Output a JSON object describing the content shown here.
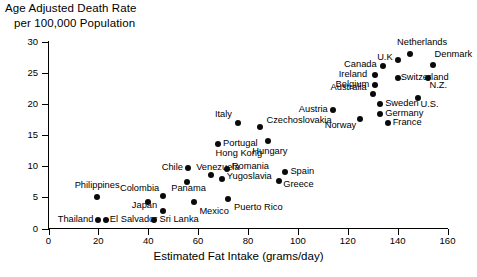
{
  "chart_data": {
    "type": "scatter",
    "title": "Age Adjusted Death Rate per 100,000 Population",
    "title_line1": "Age Adjusted Death Rate",
    "title_line2": "per 100,000 Population",
    "xlabel": "Estimated Fat Intake (grams/day)",
    "ylabel": "Age Adjusted Death Rate per 100,000 Population",
    "xlim": [
      0,
      160
    ],
    "ylim": [
      0,
      30
    ],
    "xticks": [
      0,
      20,
      40,
      60,
      80,
      100,
      120,
      140,
      160
    ],
    "yticks": [
      0,
      5,
      10,
      15,
      20,
      25,
      30
    ],
    "grid": false,
    "legend": "none",
    "marker_color": "#0a0a0a",
    "points": [
      {
        "label": "Thailand",
        "x": 20,
        "y": 1.4,
        "lx": 20,
        "ly": 1.4,
        "align": "r",
        "dx": -5,
        "dy": 0
      },
      {
        "label": "El Salvador",
        "x": 23,
        "y": 1.4,
        "lx": 23,
        "ly": 1.4,
        "align": "l",
        "dx": 4,
        "dy": 0
      },
      {
        "label": "Sri Lanka",
        "x": 42.5,
        "y": 1.4,
        "lx": 42.5,
        "ly": 1.4,
        "align": "l",
        "dx": 5,
        "dy": 0
      },
      {
        "label": "Philippines",
        "x": 19.5,
        "y": 5.1,
        "lx": 19.5,
        "ly": 5.1,
        "align": "c",
        "dx": 0,
        "dy": -11
      },
      {
        "label": "Japan",
        "x": 46,
        "y": 2.8,
        "lx": 46,
        "ly": 2.8,
        "align": "r",
        "dx": -6,
        "dy": -5
      },
      {
        "label": "Colombia",
        "x": 40,
        "y": 4.3,
        "lx": 46,
        "ly": 6.4,
        "align": "r",
        "dx": -4,
        "dy": 0
      },
      {
        "label": "Panama",
        "x": 46,
        "y": 5.2,
        "lx": 48,
        "ly": 6.4,
        "align": "l",
        "dx": 3,
        "dy": 0
      },
      {
        "label": "Mexico",
        "x": 58.5,
        "y": 4.3,
        "lx": 58.5,
        "ly": 4.3,
        "align": "l",
        "dx": 5,
        "dy": 10
      },
      {
        "label": "Chile",
        "x": 55.5,
        "y": 7.4,
        "lx": 55.5,
        "ly": 9.7,
        "align": "r",
        "dx": -4,
        "dy": 0
      },
      {
        "label": "Venezuela",
        "x": 56,
        "y": 9.7,
        "lx": 58,
        "ly": 9.7,
        "align": "l",
        "dx": 3,
        "dy": 0
      },
      {
        "label": "Hong Kong",
        "x": 65,
        "y": 8.6,
        "lx": 65,
        "ly": 12.0,
        "align": "l",
        "dx": 5,
        "dy": 0
      },
      {
        "label": "Portugal",
        "x": 68,
        "y": 13.5,
        "lx": 68,
        "ly": 13.5,
        "align": "l",
        "dx": 5,
        "dy": 0
      },
      {
        "label": "Romania",
        "x": 71.5,
        "y": 9.5,
        "lx": 71.5,
        "ly": 9.8,
        "align": "l",
        "dx": 5,
        "dy": 0
      },
      {
        "label": "Yugoslavia",
        "x": 69.5,
        "y": 8.0,
        "lx": 69.5,
        "ly": 8.2,
        "align": "l",
        "dx": 5,
        "dy": 0
      },
      {
        "label": "Puerto Rico",
        "x": 72,
        "y": 4.8,
        "lx": 72,
        "ly": 4.8,
        "align": "l",
        "dx": 6,
        "dy": 9
      },
      {
        "label": "Italy",
        "x": 76,
        "y": 17.0,
        "lx": 76,
        "ly": 17.0,
        "align": "r",
        "dx": -6,
        "dy": -8
      },
      {
        "label": "Czechoslovakia",
        "x": 85,
        "y": 16.3,
        "lx": 85,
        "ly": 16.3,
        "align": "l",
        "dx": 6,
        "dy": -6
      },
      {
        "label": "Hungary",
        "x": 88,
        "y": 14.1,
        "lx": 88,
        "ly": 14.1,
        "align": "c",
        "dx": 2,
        "dy": 11
      },
      {
        "label": "Spain",
        "x": 95,
        "y": 9.0,
        "lx": 95,
        "ly": 9.0,
        "align": "l",
        "dx": 5,
        "dy": 0
      },
      {
        "label": "Greece",
        "x": 92.5,
        "y": 7.6,
        "lx": 92.5,
        "ly": 7.6,
        "align": "l",
        "dx": 4,
        "dy": 4
      },
      {
        "label": "Austria",
        "x": 114,
        "y": 19.0,
        "lx": 114,
        "ly": 19.0,
        "align": "r",
        "dx": -5,
        "dy": 0
      },
      {
        "label": "Norway",
        "x": 125,
        "y": 17.6,
        "lx": 125,
        "ly": 17.6,
        "align": "r",
        "dx": -4,
        "dy": 7
      },
      {
        "label": "Australia",
        "x": 130,
        "y": 21.5,
        "lx": 130,
        "ly": 21.5,
        "align": "r",
        "dx": -6,
        "dy": -6
      },
      {
        "label": "Belgium",
        "x": 131,
        "y": 23.0,
        "lx": 131,
        "ly": 23.0,
        "align": "r",
        "dx": -6,
        "dy": 0
      },
      {
        "label": "Ireland",
        "x": 131,
        "y": 24.6,
        "lx": 131,
        "ly": 24.6,
        "align": "r",
        "dx": -8,
        "dy": 0
      },
      {
        "label": "Canada",
        "x": 134,
        "y": 26.1,
        "lx": 134,
        "ly": 26.1,
        "align": "r",
        "dx": -6,
        "dy": -1
      },
      {
        "label": "Switzerland",
        "x": 140,
        "y": 24.2,
        "lx": 140,
        "ly": 24.2,
        "align": "l",
        "dx": 3,
        "dy": 0
      },
      {
        "label": "U.K",
        "x": 140,
        "y": 27.0,
        "lx": 140,
        "ly": 27.0,
        "align": "r",
        "dx": -5,
        "dy": -2
      },
      {
        "label": "Netherlands",
        "x": 145,
        "y": 28.0,
        "lx": 145,
        "ly": 28.0,
        "align": "c",
        "dx": 12,
        "dy": -11
      },
      {
        "label": "Denmark",
        "x": 154,
        "y": 26.2,
        "lx": 154,
        "ly": 26.2,
        "align": "l",
        "dx": 2,
        "dy": -10
      },
      {
        "label": "N.Z.",
        "x": 152,
        "y": 24.2,
        "lx": 152,
        "ly": 24.2,
        "align": "l",
        "dx": 2,
        "dy": 8
      },
      {
        "label": "U.S.",
        "x": 148,
        "y": 21.0,
        "lx": 148,
        "ly": 21.0,
        "align": "l",
        "dx": 3,
        "dy": 7
      },
      {
        "label": "Sweden",
        "x": 133,
        "y": 20.0,
        "lx": 133,
        "ly": 20.0,
        "align": "l",
        "dx": 5,
        "dy": 0
      },
      {
        "label": "Germany",
        "x": 133,
        "y": 18.4,
        "lx": 133,
        "ly": 18.4,
        "align": "l",
        "dx": 5,
        "dy": 0
      },
      {
        "label": "France",
        "x": 136,
        "y": 16.9,
        "lx": 136,
        "ly": 16.9,
        "align": "l",
        "dx": 5,
        "dy": 0
      }
    ]
  }
}
